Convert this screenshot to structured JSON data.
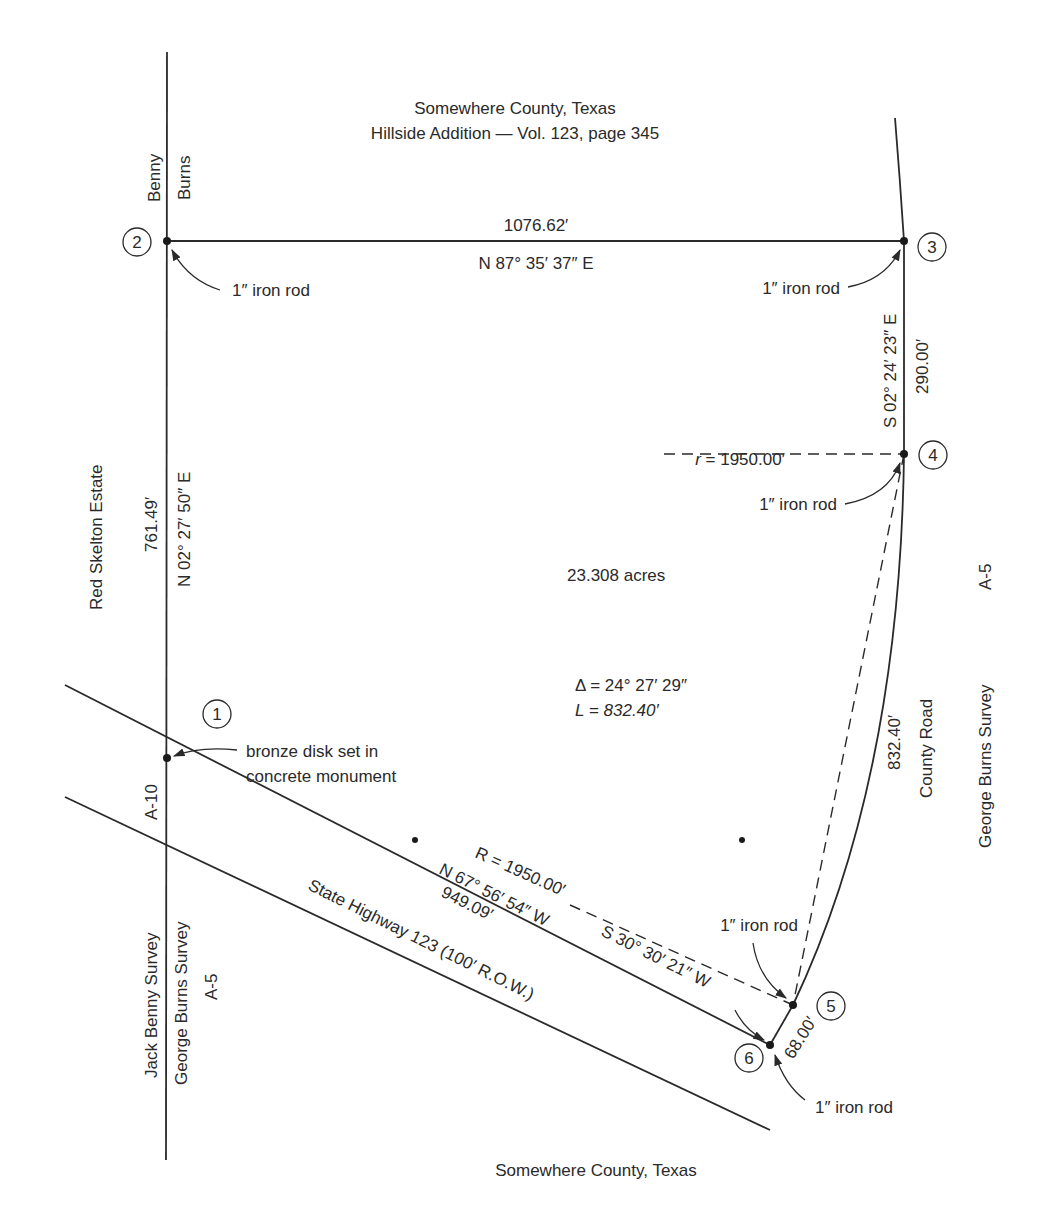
{
  "header": {
    "county": "Somewhere County, Texas",
    "addition": "Hillside Addition — Vol. 123, page 345"
  },
  "footer": {
    "county": "Somewhere County, Texas"
  },
  "area": "23.308 acres",
  "points": [
    {
      "id": "1",
      "label": "1",
      "monument": "bronze disk set in",
      "monument_line2": "concrete monument"
    },
    {
      "id": "2",
      "label": "2",
      "monument": "1″ iron rod"
    },
    {
      "id": "3",
      "label": "3",
      "monument": "1″ iron rod"
    },
    {
      "id": "4",
      "label": "4",
      "monument": "1″ iron rod"
    },
    {
      "id": "5",
      "label": "5",
      "monument": "1″ iron rod"
    },
    {
      "id": "6",
      "label": "6",
      "monument": "1″ iron rod"
    }
  ],
  "courses": {
    "north": {
      "distance": "1076.62′",
      "bearing": "N 87° 35′ 37″ E"
    },
    "west": {
      "distance": "761.49′",
      "bearing": "N 02° 27′ 50″ E"
    },
    "east_upper": {
      "distance": "290.00′",
      "bearing": "S 02° 24′ 23″ E"
    },
    "curve": {
      "radius_small": "r = 1950.00′",
      "radius_chord": "R = 1950.00′",
      "delta": "Δ = 24° 27′ 29″",
      "length": "L = 832.40′",
      "arc_distance": "832.40′",
      "chord_bearing": "S 30° 30′ 21″ W"
    },
    "short": {
      "distance": "68.00′"
    },
    "south": {
      "distance": "949.09′",
      "bearing": "N 67° 56′ 54″ W"
    }
  },
  "adjoiners": {
    "benny": "Benny",
    "burns": "Burns",
    "red_skelton": "Red Skelton Estate",
    "a10": "A-10",
    "jack_benny_survey": "Jack Benny Survey",
    "george_burns_survey_left": "George Burns Survey",
    "a5_left": "A-5",
    "county_road": "County Road",
    "george_burns_survey_right": "George Burns Survey",
    "a5_right": "A-5",
    "state_highway": "State Highway 123  (100′ R.O.W.)"
  }
}
